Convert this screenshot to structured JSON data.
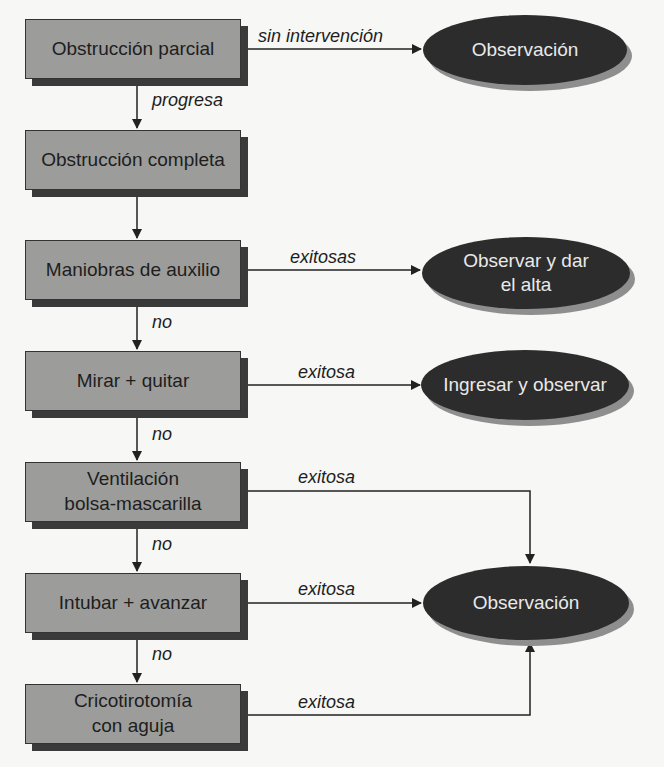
{
  "boxes": [
    {
      "id": "obstruccion-parcial",
      "text": "Obstrucción parcial"
    },
    {
      "id": "obstruccion-completa",
      "text": "Obstrucción completa"
    },
    {
      "id": "maniobras-auxilio",
      "text": "Maniobras de auxilio"
    },
    {
      "id": "mirar-quitar",
      "text": "Mirar + quitar"
    },
    {
      "id": "ventilacion-line1",
      "text": "Ventilación"
    },
    {
      "id": "ventilacion-line2",
      "text": "bolsa-mascarilla"
    },
    {
      "id": "intubar-avanzar",
      "text": "Intubar + avanzar"
    },
    {
      "id": "cricotirotomia-line1",
      "text": "Cricotirotomía"
    },
    {
      "id": "cricotirotomia-line2",
      "text": "con aguja"
    }
  ],
  "outcomes": {
    "observacion_top": "Observación",
    "observar_alta_line1": "Observar y dar",
    "observar_alta_line2": "el alta",
    "ingresar_observar": "Ingresar y observar",
    "observacion_bottom": "Observación"
  },
  "edge_labels": {
    "sin_intervencion": "sin intervención",
    "progresa": "progresa",
    "exitosas": "exitosas",
    "no_1": "no",
    "exitosa_1": "exitosa",
    "no_2": "no",
    "exitosa_2": "exitosa",
    "no_3": "no",
    "exitosa_3": "exitosa",
    "no_4": "no",
    "exitosa_4": "exitosa"
  },
  "colors": {
    "box_fill": "#9c9c9a",
    "ellipse_fill": "#2c2c2c",
    "line": "#222222"
  }
}
